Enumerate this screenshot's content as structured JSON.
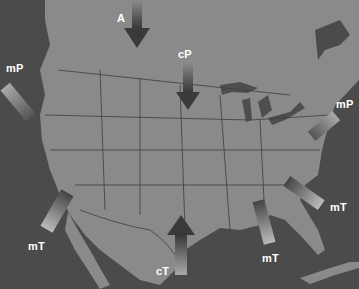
{
  "map": {
    "title": "North American Air Masses",
    "colors": {
      "ocean": "#4b4b4b",
      "land": "#8a8a8a",
      "borders": "#3c3c3c",
      "lakes": "#4e4e4e",
      "label": "#ffffff"
    },
    "air_masses": [
      {
        "id": "A",
        "label": "A",
        "direction": "south",
        "region": "north-central"
      },
      {
        "id": "cP",
        "label": "cP",
        "direction": "south",
        "region": "central Canada"
      },
      {
        "id": "mP-west",
        "label": "mP",
        "direction": "southeast",
        "region": "Pacific northwest"
      },
      {
        "id": "mP-east",
        "label": "mP",
        "direction": "southwest",
        "region": "North Atlantic"
      },
      {
        "id": "mT-pacific",
        "label": "mT",
        "direction": "northeast",
        "region": "Pacific southwest"
      },
      {
        "id": "cT",
        "label": "cT",
        "direction": "north",
        "region": "Mexico/Southwest"
      },
      {
        "id": "mT-gulf",
        "label": "mT",
        "direction": "north",
        "region": "Gulf of Mexico"
      },
      {
        "id": "mT-atlantic",
        "label": "mT",
        "direction": "northwest",
        "region": "Atlantic"
      }
    ]
  }
}
